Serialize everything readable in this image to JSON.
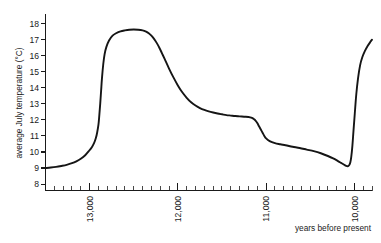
{
  "chart_data": {
    "type": "line",
    "title": "",
    "xlabel": "years before present",
    "ylabel": "average July temperature (°C)",
    "xlim": [
      13500,
      9800
    ],
    "ylim": [
      7.6,
      18.6
    ],
    "x_axis_direction": "decreasing",
    "grid": false,
    "legend": false,
    "y_ticks": [
      8,
      9,
      10,
      11,
      12,
      13,
      14,
      15,
      16,
      17,
      18
    ],
    "y_tick_labels": [
      "8",
      "9",
      "10",
      "11",
      "12",
      "13",
      "14",
      "15",
      "16",
      "17",
      "18"
    ],
    "x_ticks": [
      13000,
      12000,
      11000,
      10000
    ],
    "x_tick_labels": [
      "13,000",
      "12,000",
      "11,000",
      "10,000"
    ],
    "x_minor_tick_interval": 100,
    "x_tick_label_rotation": -90,
    "series": [
      {
        "name": "average July temperature",
        "color": "#151515",
        "x": [
          13500,
          13440,
          13380,
          13320,
          13260,
          13200,
          13150,
          13100,
          13050,
          13010,
          12975,
          12950,
          12930,
          12915,
          12900,
          12890,
          12880,
          12870,
          12860,
          12845,
          12830,
          12810,
          12780,
          12740,
          12700,
          12650,
          12600,
          12550,
          12500,
          12450,
          12400,
          12360,
          12330,
          12300,
          12270,
          12240,
          12210,
          12180,
          12150,
          12100,
          12050,
          12000,
          11950,
          11900,
          11850,
          11800,
          11750,
          11700,
          11650,
          11600,
          11550,
          11500,
          11450,
          11400,
          11350,
          11300,
          11250,
          11200,
          11180,
          11160,
          11140,
          11120,
          11100,
          11080,
          11060,
          11040,
          11020,
          11000,
          10960,
          10900,
          10840,
          10780,
          10700,
          10620,
          10540,
          10460,
          10380,
          10300,
          10240,
          10190,
          10150,
          10120,
          10100,
          10085,
          10070,
          10058,
          10046,
          10035,
          10022,
          10010,
          9995,
          9978,
          9958,
          9935,
          9910,
          9880,
          9850,
          9820,
          9800
        ],
        "y": [
          9.0,
          9.03,
          9.07,
          9.13,
          9.2,
          9.3,
          9.42,
          9.58,
          9.8,
          10.05,
          10.3,
          10.55,
          10.85,
          11.2,
          11.7,
          12.3,
          13.0,
          13.8,
          14.6,
          15.5,
          16.1,
          16.55,
          16.95,
          17.25,
          17.4,
          17.52,
          17.58,
          17.62,
          17.63,
          17.62,
          17.58,
          17.5,
          17.4,
          17.25,
          17.05,
          16.8,
          16.5,
          16.15,
          15.8,
          15.2,
          14.65,
          14.15,
          13.72,
          13.38,
          13.1,
          12.9,
          12.74,
          12.62,
          12.53,
          12.46,
          12.4,
          12.35,
          12.3,
          12.27,
          12.24,
          12.22,
          12.2,
          12.18,
          12.16,
          12.12,
          12.05,
          11.95,
          11.8,
          11.6,
          11.4,
          11.2,
          11.0,
          10.85,
          10.68,
          10.55,
          10.48,
          10.42,
          10.33,
          10.25,
          10.15,
          10.05,
          9.92,
          9.75,
          9.6,
          9.45,
          9.32,
          9.22,
          9.15,
          9.12,
          9.12,
          9.18,
          9.35,
          9.7,
          10.4,
          11.3,
          12.4,
          13.6,
          14.6,
          15.4,
          15.9,
          16.3,
          16.6,
          16.85,
          17.0
        ]
      }
    ]
  }
}
